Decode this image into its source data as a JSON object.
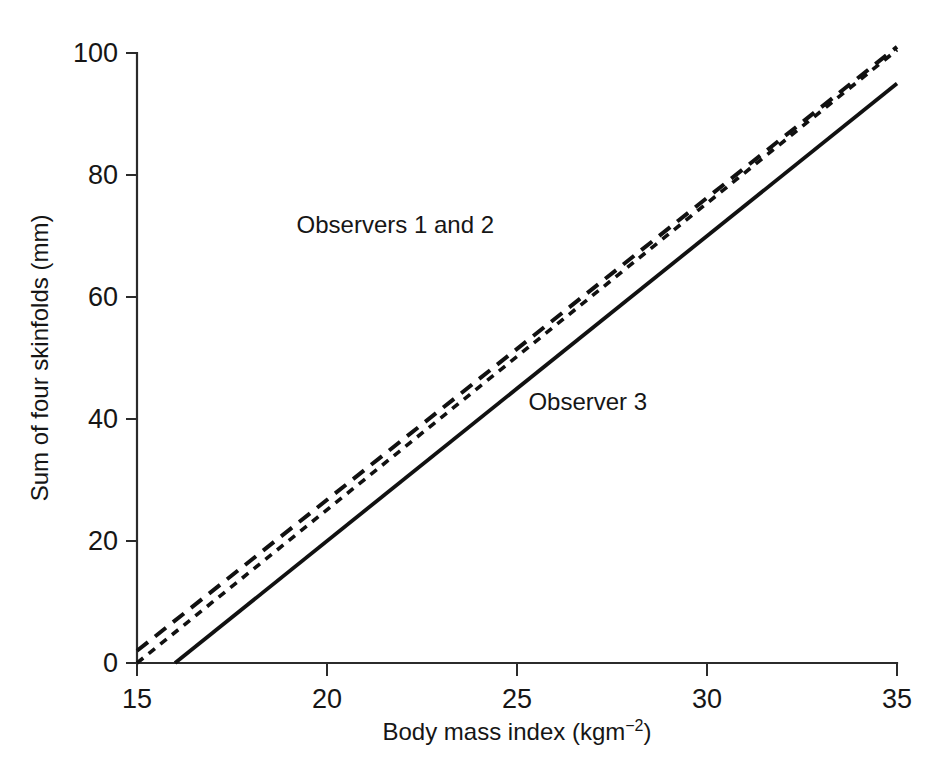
{
  "figure": {
    "background_color": "#ffffff",
    "line_color": "#111111",
    "axis_color": "#2b2b2b"
  },
  "chart_data": {
    "type": "line",
    "title": "",
    "xlabel": "Body mass index (kgm",
    "xlabel_superscript": "−2",
    "xlabel_suffix": ")",
    "xlabel_full": "Body mass index (kgm−2)",
    "ylabel": "Sum of four skinfolds (mm)",
    "xlim": [
      15,
      35
    ],
    "ylim": [
      0,
      100
    ],
    "xticks": [
      15,
      20,
      25,
      30,
      35
    ],
    "xtick_labels": [
      "15",
      "20",
      "25",
      "30",
      "35"
    ],
    "yticks": [
      0,
      20,
      40,
      60,
      80,
      100
    ],
    "ytick_labels": [
      "0",
      "20",
      "40",
      "60",
      "80",
      "100"
    ],
    "grid": false,
    "legend": "inline-annotations",
    "series": [
      {
        "name": "Observer 1",
        "style": "long-dash",
        "dash_pattern": "14 9",
        "stroke_width": 4.0,
        "x": [
          15,
          35
        ],
        "y": [
          2.0,
          101.0
        ]
      },
      {
        "name": "Observer 2",
        "style": "short-dash",
        "dash_pattern": "8 7",
        "stroke_width": 3.6,
        "x": [
          15,
          35
        ],
        "y": [
          0.0,
          100.5
        ]
      },
      {
        "name": "Observer 3",
        "style": "solid",
        "dash_pattern": "",
        "stroke_width": 3.8,
        "x": [
          16.0,
          35
        ],
        "y": [
          0.0,
          95.0
        ]
      }
    ],
    "annotations": [
      {
        "text": "Observers 1 and 2",
        "x": 19.2,
        "y": 70.5
      },
      {
        "text": "Observer 3",
        "x": 25.3,
        "y": 41.5
      }
    ]
  }
}
